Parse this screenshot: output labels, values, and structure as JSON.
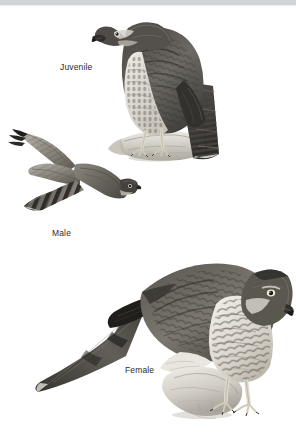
{
  "plate": {
    "width": 296,
    "height": 437,
    "background_color": "#ffffff",
    "top_band_color": "#d2d3d5",
    "caption_color": "#2b2b2b",
    "subject": "Sharp-shinned Hawk plumages",
    "medium": "graphite / grayscale illustration"
  },
  "figures": [
    {
      "id": "juvenile",
      "label": "Juvenile",
      "pose": "perched on log, facing left, long barred tail hanging down-right",
      "label_position": {
        "x": 60,
        "y": 62
      }
    },
    {
      "id": "male",
      "label": "Male",
      "pose": "in flight, seen from above, wings spread, banded tail to lower left",
      "label_position": {
        "x": 52,
        "y": 228
      }
    },
    {
      "id": "female",
      "label": "Female",
      "pose": "perched on rock, hunched forward, head lowered to right, long tail to left",
      "label_position": {
        "x": 125,
        "y": 365
      }
    }
  ]
}
